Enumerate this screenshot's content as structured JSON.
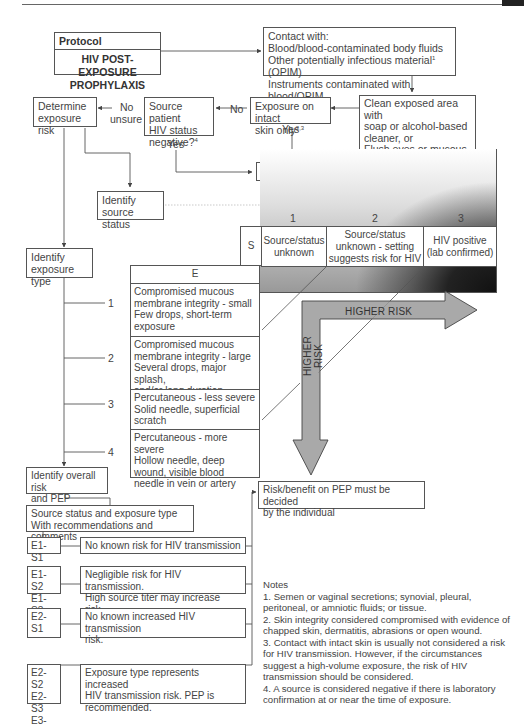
{
  "header": {
    "rule": true
  },
  "protocol": {
    "label": "Protocol",
    "title_line1": "HIV POST-EXPOSURE",
    "title_line2": "PROPHYLAXIS"
  },
  "contact_box": {
    "line1": "Contact with:",
    "line2": "Blood/blood-contaminated body fluids",
    "line3a": "Other potentially infectious material",
    "line3_sup": "1",
    "line3b": " (OPIM)",
    "line4": "Instruments contaminated with blood/OPIM"
  },
  "clean_box": {
    "line1": "Clean exposed area with",
    "line2": "soap or alcohol-based",
    "line3": "cleaner, or",
    "line4": "Flush eyes or mucous",
    "line5": "membranes with water or",
    "line6": "normal saline"
  },
  "intact_skin_box": {
    "line1": "Exposure on intact",
    "line2": "skin only",
    "sup": "2,3"
  },
  "source_negative_box": {
    "line1": "Source patient",
    "line2": "HIV status",
    "line3": "negative?",
    "sup": "4"
  },
  "determine_box": {
    "line1": "Determine",
    "line2": "exposure risk"
  },
  "no_pep_box": {
    "label": "No PEP needed"
  },
  "identify_source_box": {
    "line1": "Identify source",
    "line2": "status"
  },
  "identify_exposure_box": {
    "line1": "Identify",
    "line2": "exposure type"
  },
  "edge_labels": {
    "no_1": "No",
    "no_2": "No",
    "unsure": "unsure",
    "yes_1": "Yes",
    "yes_2": "Yes"
  },
  "matrix": {
    "s_label": "S",
    "e_label": "E",
    "source_numbers": [
      "1",
      "2",
      "3"
    ],
    "source_headers": [
      {
        "line1": "Source/status",
        "line2": "unknown",
        "line3": ""
      },
      {
        "line1": "Source/status",
        "line2": "unknown - setting",
        "line3": "suggests risk for HIV"
      },
      {
        "line1": "HIV positive",
        "line2": "(lab confirmed)",
        "line3": ""
      }
    ],
    "exposure_numbers": [
      "1",
      "2",
      "3",
      "4"
    ],
    "exposure_rows": [
      {
        "l1": "Compromised mucous",
        "l2": "membrane integrity - small",
        "l3": "Few drops, short-term",
        "l4": "exposure"
      },
      {
        "l1": "Compromised mucous",
        "l2": "membrane integrity - large",
        "l3": "Several drops, major splash,",
        "l4": "and/or long duration"
      },
      {
        "l1": "Percutaneous - less severe",
        "l2": "Solid needle, superficial",
        "l3": "scratch",
        "l4": ""
      },
      {
        "l1": "Percutaneous - more severe",
        "l2": "Hollow needle, deep",
        "l3": "wound, visible blood",
        "l4": "needle in vein or artery"
      }
    ],
    "arrow_horizontal_label": "HIGHER RISK",
    "arrow_vertical_label": "HIGHER RISK"
  },
  "overall_box": {
    "line1": "Identify overall risk",
    "line2": "and PEP indicated"
  },
  "source_exposure_box": {
    "line1": "Source status and exposure type",
    "line2": "With recommendations and comments"
  },
  "results": [
    {
      "codes": [
        "E1-S1"
      ],
      "text1": "No known risk for HIV transmission",
      "text2": "",
      "text3": ""
    },
    {
      "codes": [
        "E1-S2",
        "E1-S3"
      ],
      "text1": "Negligible risk for HIV transmission.",
      "text2": "High source titer may increase risk.",
      "text3": ""
    },
    {
      "codes": [
        "E2-S1"
      ],
      "text1": "No known increased HIV transmission",
      "text2": "risk.",
      "text3": ""
    },
    {
      "codes": [
        "E2-S2",
        "E2-S3",
        "E3-All"
      ],
      "text1": "Exposure type represents increased",
      "text2": "HIV transmission risk. PEP is",
      "text3": "recommended."
    }
  ],
  "risk_benefit_box": {
    "line1": "Risk/benefit on PEP must be decided",
    "line2": "by the individual"
  },
  "notes": {
    "title": "Notes",
    "items": [
      "1. Semen or vaginal secretions; synovial, pleural, peritoneal, or amniotic fluids; or tissue.",
      "2. Skin integrity considered compromised with evidence of chapped skin, dermatitis, abrasions or open wound.",
      "3. Contact with intact skin is usually not considered a risk for HIV transmission. However, if the circumstances suggest a high-volume exposure, the risk of HIV transmission should be considered.",
      "4. A source is considered negative if there is laboratory confirmation at or near the time of exposure."
    ]
  }
}
